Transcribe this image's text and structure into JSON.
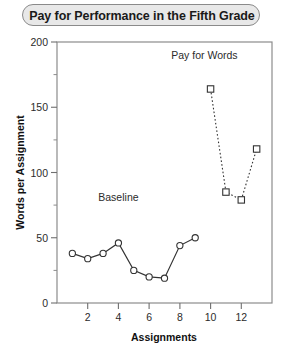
{
  "title": "Pay for Performance in the Fifth Grade",
  "chart_data": {
    "type": "line",
    "title": "Pay for Performance in the Fifth Grade",
    "subtitle": "",
    "xlabel": "Assignments",
    "ylabel": "Words per Assignment",
    "xlim": [
      0,
      14
    ],
    "ylim": [
      0,
      200
    ],
    "xticks": [
      2,
      4,
      6,
      8,
      10,
      12
    ],
    "xtick_labels": [
      "2",
      "4",
      "6",
      "8",
      "10",
      "12"
    ],
    "yticks": [
      0,
      50,
      100,
      150,
      200
    ],
    "ytick_labels": [
      "0",
      "50",
      "100",
      "150",
      "200"
    ],
    "y_minor_ticks": [
      25,
      75,
      125,
      175
    ],
    "grid": false,
    "legend_position": "none",
    "annotations": [
      {
        "text": "Baseline",
        "x": 4.0,
        "y": 78
      },
      {
        "text": "Pay for Words",
        "x": 9.6,
        "y": 187
      }
    ],
    "series": [
      {
        "name": "Baseline",
        "marker": "circle-open",
        "linestyle": "solid",
        "color": "#333333",
        "x": [
          1,
          2,
          3,
          4,
          5,
          6,
          7,
          8,
          9
        ],
        "y": [
          38,
          34,
          38,
          46,
          25,
          20,
          19,
          44,
          50
        ]
      },
      {
        "name": "Pay for Words",
        "marker": "square-open",
        "linestyle": "dashed",
        "color": "#333333",
        "x": [
          10,
          11,
          12,
          13
        ],
        "y": [
          164,
          85,
          79,
          118
        ]
      }
    ]
  },
  "axes": {
    "x_label": "Assignments",
    "y_label": "Words per Assignment"
  }
}
